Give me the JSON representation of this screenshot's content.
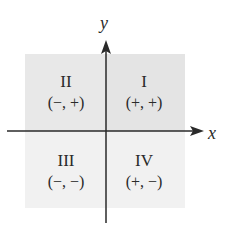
{
  "diagram": {
    "type": "cartesian-quadrants",
    "axes": {
      "x_label": "x",
      "y_label": "y"
    },
    "quadrants": [
      {
        "numeral": "I",
        "signs": "(+, +)",
        "position": "top-right"
      },
      {
        "numeral": "II",
        "signs": "(−, +)",
        "position": "top-left"
      },
      {
        "numeral": "III",
        "signs": "(−, −)",
        "position": "bottom-left"
      },
      {
        "numeral": "IV",
        "signs": "(+, −)",
        "position": "bottom-right"
      }
    ],
    "colors": {
      "upper_shade": "#e6e6e6",
      "lower_shade": "#f1f1f1",
      "axis": "#2a2a2a"
    }
  }
}
